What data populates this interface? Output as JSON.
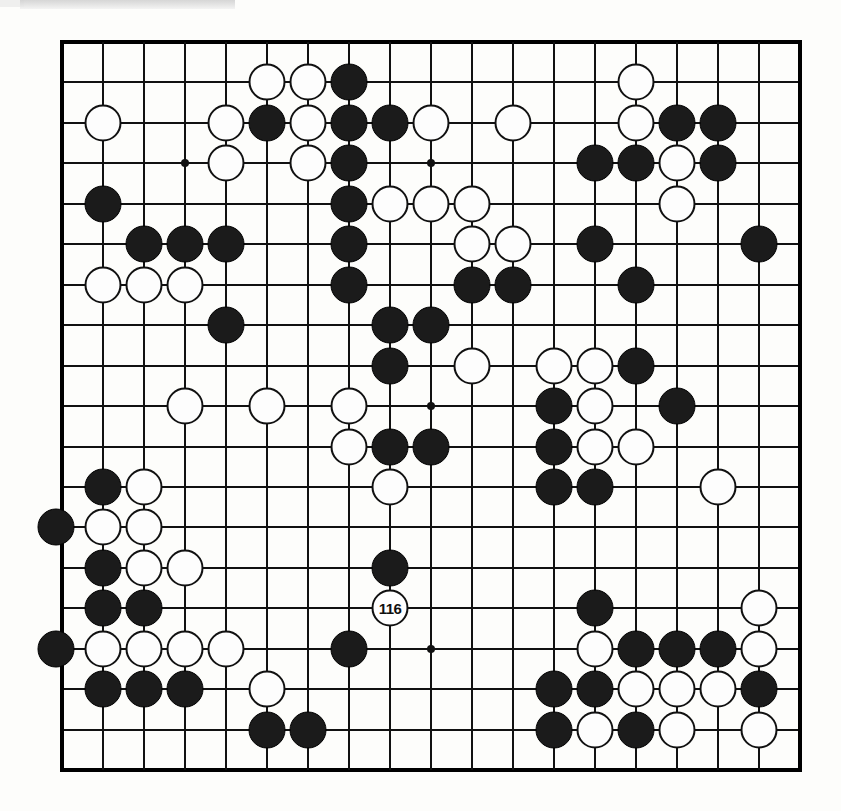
{
  "diagram": {
    "kind": "go-board-diagram",
    "board_size": 19,
    "move_label": "116",
    "move_color": "white",
    "move_position": {
      "col": 9,
      "row": 15
    },
    "colors": {
      "black": "#1b1b1b",
      "white": "#fdfdfd",
      "line": "#111111",
      "paper": "#fdfdfb"
    }
  },
  "geometry": {
    "left": 62,
    "top": 42,
    "col_step": 41.0,
    "row_step": 40.45,
    "stone_diameter": 37,
    "star_diameter": 8
  },
  "star_points": [
    {
      "col": 4,
      "row": 4
    },
    {
      "col": 10,
      "row": 4
    },
    {
      "col": 16,
      "row": 4
    },
    {
      "col": 4,
      "row": 10
    },
    {
      "col": 10,
      "row": 10
    },
    {
      "col": 16,
      "row": 10
    },
    {
      "col": 4,
      "row": 16
    },
    {
      "col": 10,
      "row": 16
    },
    {
      "col": 16,
      "row": 16
    }
  ],
  "stones": [
    {
      "c": "w",
      "col": 6,
      "row": 2
    },
    {
      "c": "w",
      "col": 7,
      "row": 2
    },
    {
      "c": "b",
      "col": 8,
      "row": 2
    },
    {
      "c": "w",
      "col": 15,
      "row": 2
    },
    {
      "c": "w",
      "col": 2,
      "row": 3
    },
    {
      "c": "w",
      "col": 5,
      "row": 3
    },
    {
      "c": "b",
      "col": 6,
      "row": 3
    },
    {
      "c": "w",
      "col": 7,
      "row": 3
    },
    {
      "c": "b",
      "col": 8,
      "row": 3
    },
    {
      "c": "b",
      "col": 9,
      "row": 3
    },
    {
      "c": "w",
      "col": 10,
      "row": 3
    },
    {
      "c": "w",
      "col": 12,
      "row": 3
    },
    {
      "c": "w",
      "col": 15,
      "row": 3
    },
    {
      "c": "b",
      "col": 16,
      "row": 3
    },
    {
      "c": "b",
      "col": 17,
      "row": 3
    },
    {
      "c": "w",
      "col": 5,
      "row": 4
    },
    {
      "c": "w",
      "col": 7,
      "row": 4
    },
    {
      "c": "b",
      "col": 8,
      "row": 4
    },
    {
      "c": "b",
      "col": 14,
      "row": 4
    },
    {
      "c": "b",
      "col": 15,
      "row": 4
    },
    {
      "c": "w",
      "col": 16,
      "row": 4
    },
    {
      "c": "b",
      "col": 17,
      "row": 4
    },
    {
      "c": "b",
      "col": 2,
      "row": 5
    },
    {
      "c": "b",
      "col": 8,
      "row": 5
    },
    {
      "c": "w",
      "col": 9,
      "row": 5
    },
    {
      "c": "w",
      "col": 10,
      "row": 5
    },
    {
      "c": "w",
      "col": 11,
      "row": 5
    },
    {
      "c": "w",
      "col": 16,
      "row": 5
    },
    {
      "c": "b",
      "col": 3,
      "row": 6
    },
    {
      "c": "b",
      "col": 4,
      "row": 6
    },
    {
      "c": "b",
      "col": 5,
      "row": 6
    },
    {
      "c": "b",
      "col": 8,
      "row": 6
    },
    {
      "c": "w",
      "col": 11,
      "row": 6
    },
    {
      "c": "w",
      "col": 12,
      "row": 6
    },
    {
      "c": "b",
      "col": 14,
      "row": 6
    },
    {
      "c": "b",
      "col": 18,
      "row": 6
    },
    {
      "c": "w",
      "col": 2,
      "row": 7
    },
    {
      "c": "w",
      "col": 3,
      "row": 7
    },
    {
      "c": "w",
      "col": 4,
      "row": 7
    },
    {
      "c": "b",
      "col": 8,
      "row": 7
    },
    {
      "c": "b",
      "col": 11,
      "row": 7
    },
    {
      "c": "b",
      "col": 12,
      "row": 7
    },
    {
      "c": "b",
      "col": 15,
      "row": 7
    },
    {
      "c": "b",
      "col": 5,
      "row": 8
    },
    {
      "c": "b",
      "col": 9,
      "row": 8
    },
    {
      "c": "b",
      "col": 10,
      "row": 8
    },
    {
      "c": "b",
      "col": 9,
      "row": 9
    },
    {
      "c": "w",
      "col": 11,
      "row": 9
    },
    {
      "c": "w",
      "col": 13,
      "row": 9
    },
    {
      "c": "w",
      "col": 14,
      "row": 9
    },
    {
      "c": "b",
      "col": 15,
      "row": 9
    },
    {
      "c": "w",
      "col": 4,
      "row": 10
    },
    {
      "c": "w",
      "col": 6,
      "row": 10
    },
    {
      "c": "w",
      "col": 8,
      "row": 10
    },
    {
      "c": "b",
      "col": 13,
      "row": 10
    },
    {
      "c": "w",
      "col": 14,
      "row": 10
    },
    {
      "c": "b",
      "col": 16,
      "row": 10
    },
    {
      "c": "w",
      "col": 8,
      "row": 11
    },
    {
      "c": "b",
      "col": 9,
      "row": 11
    },
    {
      "c": "b",
      "col": 10,
      "row": 11
    },
    {
      "c": "b",
      "col": 13,
      "row": 11
    },
    {
      "c": "w",
      "col": 14,
      "row": 11
    },
    {
      "c": "w",
      "col": 15,
      "row": 11
    },
    {
      "c": "b",
      "col": 2,
      "row": 12
    },
    {
      "c": "w",
      "col": 3,
      "row": 12
    },
    {
      "c": "w",
      "col": 9,
      "row": 12
    },
    {
      "c": "b",
      "col": 13,
      "row": 12
    },
    {
      "c": "b",
      "col": 14,
      "row": 12
    },
    {
      "c": "w",
      "col": 17,
      "row": 12
    },
    {
      "c": "b",
      "col": 1,
      "row": 13
    },
    {
      "c": "w",
      "col": 2,
      "row": 13
    },
    {
      "c": "w",
      "col": 3,
      "row": 13
    },
    {
      "c": "b",
      "col": 2,
      "row": 14
    },
    {
      "c": "w",
      "col": 3,
      "row": 14
    },
    {
      "c": "w",
      "col": 4,
      "row": 14
    },
    {
      "c": "b",
      "col": 9,
      "row": 14
    },
    {
      "c": "b",
      "col": 2,
      "row": 15
    },
    {
      "c": "b",
      "col": 3,
      "row": 15
    },
    {
      "c": "b",
      "col": 14,
      "row": 15
    },
    {
      "c": "w",
      "col": 18,
      "row": 15
    },
    {
      "c": "b",
      "col": 1,
      "row": 16
    },
    {
      "c": "w",
      "col": 2,
      "row": 16
    },
    {
      "c": "w",
      "col": 3,
      "row": 16
    },
    {
      "c": "w",
      "col": 4,
      "row": 16
    },
    {
      "c": "w",
      "col": 5,
      "row": 16
    },
    {
      "c": "b",
      "col": 8,
      "row": 16
    },
    {
      "c": "w",
      "col": 14,
      "row": 16
    },
    {
      "c": "b",
      "col": 15,
      "row": 16
    },
    {
      "c": "b",
      "col": 16,
      "row": 16
    },
    {
      "c": "b",
      "col": 17,
      "row": 16
    },
    {
      "c": "w",
      "col": 18,
      "row": 16
    },
    {
      "c": "b",
      "col": 2,
      "row": 17
    },
    {
      "c": "b",
      "col": 3,
      "row": 17
    },
    {
      "c": "b",
      "col": 4,
      "row": 17
    },
    {
      "c": "w",
      "col": 6,
      "row": 17
    },
    {
      "c": "b",
      "col": 13,
      "row": 17
    },
    {
      "c": "b",
      "col": 14,
      "row": 17
    },
    {
      "c": "w",
      "col": 15,
      "row": 17
    },
    {
      "c": "w",
      "col": 16,
      "row": 17
    },
    {
      "c": "w",
      "col": 17,
      "row": 17
    },
    {
      "c": "b",
      "col": 18,
      "row": 17
    },
    {
      "c": "b",
      "col": 6,
      "row": 18
    },
    {
      "c": "b",
      "col": 7,
      "row": 18
    },
    {
      "c": "b",
      "col": 13,
      "row": 18
    },
    {
      "c": "w",
      "col": 14,
      "row": 18
    },
    {
      "c": "b",
      "col": 15,
      "row": 18
    },
    {
      "c": "w",
      "col": 16,
      "row": 18
    },
    {
      "c": "w",
      "col": 18,
      "row": 18
    }
  ]
}
